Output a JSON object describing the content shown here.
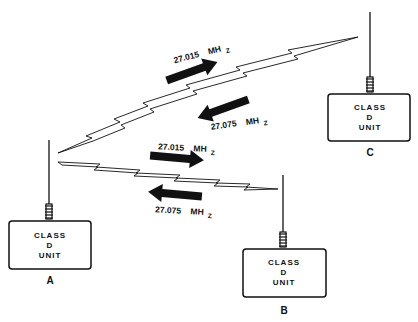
{
  "units": [
    {
      "id": "A",
      "label": "A",
      "lines": [
        "CLASS",
        "D",
        "UNIT"
      ]
    },
    {
      "id": "B",
      "label": "B",
      "lines": [
        "CLASS",
        "D",
        "UNIT"
      ]
    },
    {
      "id": "C",
      "label": "C",
      "lines": [
        "CLASS",
        "D",
        "UNIT"
      ]
    }
  ],
  "links": [
    {
      "between": "A-C",
      "transmit_freq": "27.015",
      "receive_freq": "27.075",
      "unit": "MH",
      "unit_sub": "Z"
    },
    {
      "between": "A-B",
      "transmit_freq": "27.015",
      "receive_freq": "27.075",
      "unit": "MH",
      "unit_sub": "Z"
    }
  ],
  "colors": {
    "ink": "#111111",
    "background": "#ffffff"
  }
}
